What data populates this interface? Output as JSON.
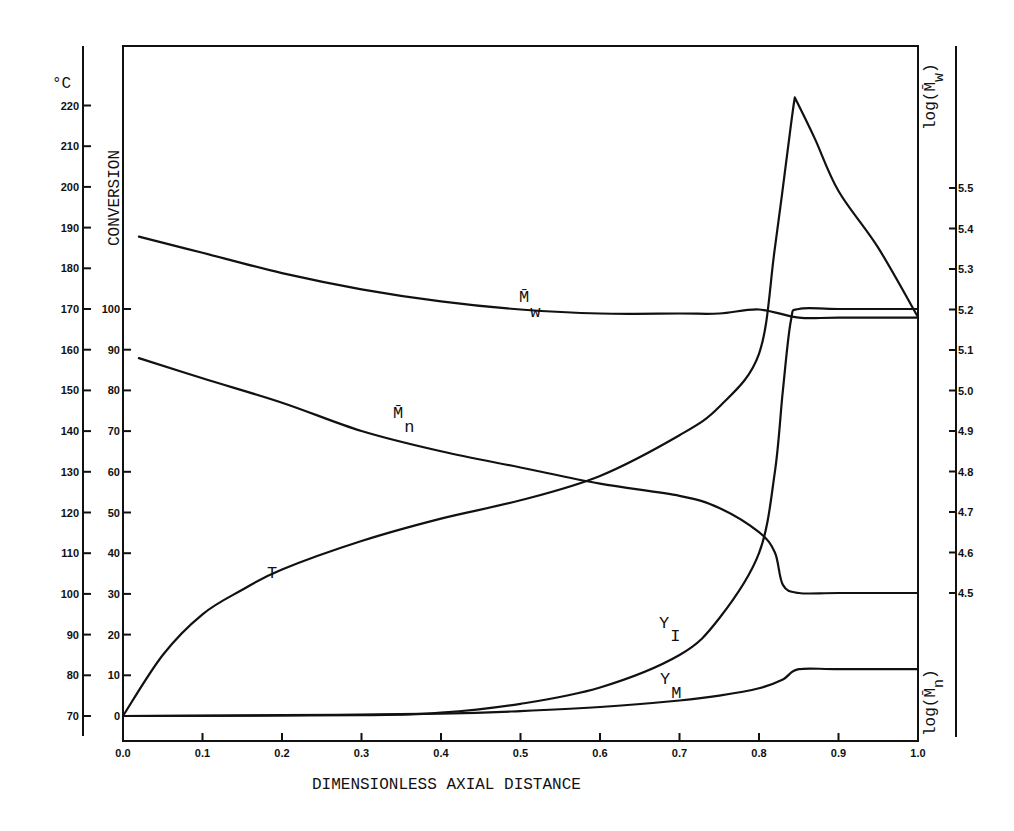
{
  "chart_data": {
    "type": "line",
    "title": "",
    "xlabel": "DIMENSIONLESS AXIAL DISTANCE",
    "xlim": [
      0.0,
      1.0
    ],
    "x_ticks": [
      "0.0",
      "0.1",
      "0.2",
      "0.3",
      "0.4",
      "0.5",
      "0.6",
      "0.7",
      "0.8",
      "0.9",
      "1.0"
    ],
    "axes": {
      "left_outer": {
        "label": "°C",
        "range": [
          70,
          220
        ],
        "ticks": [
          "220",
          "210",
          "200",
          "190",
          "180",
          "170",
          "160",
          "150",
          "140",
          "130",
          "120",
          "110",
          "100",
          "90",
          "80",
          "70"
        ]
      },
      "left_inner": {
        "label": "CONVERSION",
        "range": [
          0,
          100
        ],
        "ticks": [
          "100",
          "90",
          "80",
          "70",
          "60",
          "50",
          "40",
          "30",
          "20",
          "10",
          "0"
        ]
      },
      "right": {
        "label_top": "log(M̄w)",
        "label_bottom": "log(M̄n)",
        "range": [
          4.5,
          5.5
        ],
        "ticks": [
          "5.5",
          "5.4",
          "5.3",
          "5.2",
          "5.1",
          "5.0",
          "4.9",
          "4.8",
          "4.7",
          "4.6",
          "4.5"
        ]
      }
    },
    "grid": false,
    "legend": "inline labels",
    "series": [
      {
        "name": "T",
        "axis": "°C",
        "x": [
          0.0,
          0.05,
          0.1,
          0.15,
          0.2,
          0.3,
          0.4,
          0.5,
          0.6,
          0.7,
          0.75,
          0.8,
          0.82,
          0.84,
          0.845,
          0.87,
          0.9,
          0.95,
          1.0
        ],
        "y": [
          70,
          85,
          95,
          101,
          106,
          113,
          118.5,
          123,
          129,
          139,
          146,
          159,
          185,
          215,
          222,
          212,
          199,
          185,
          168
        ]
      },
      {
        "name": "Y_I",
        "axis": "CONVERSION",
        "x": [
          0.0,
          0.3,
          0.4,
          0.5,
          0.6,
          0.7,
          0.75,
          0.8,
          0.82,
          0.83,
          0.84,
          0.85,
          0.9,
          1.0
        ],
        "y": [
          0,
          0.2,
          0.8,
          3,
          7,
          15,
          24,
          40,
          60,
          80,
          97,
          100,
          100,
          100
        ]
      },
      {
        "name": "Y_M",
        "axis": "CONVERSION",
        "x": [
          0.0,
          0.2,
          0.4,
          0.5,
          0.6,
          0.7,
          0.75,
          0.8,
          0.83,
          0.85,
          0.9,
          1.0
        ],
        "y": [
          0,
          0.2,
          0.6,
          1.2,
          2.2,
          3.8,
          5,
          6.8,
          9,
          11.5,
          11.5,
          11.5
        ]
      },
      {
        "name": "M̄w",
        "axis": "log",
        "x": [
          0.02,
          0.1,
          0.2,
          0.3,
          0.4,
          0.5,
          0.6,
          0.7,
          0.75,
          0.8,
          0.85,
          0.9,
          1.0
        ],
        "y": [
          5.38,
          5.34,
          5.29,
          5.25,
          5.22,
          5.2,
          5.19,
          5.19,
          5.19,
          5.2,
          5.18,
          5.18,
          5.18
        ]
      },
      {
        "name": "M̄n",
        "axis": "log",
        "x": [
          0.02,
          0.1,
          0.2,
          0.3,
          0.4,
          0.5,
          0.6,
          0.7,
          0.75,
          0.8,
          0.82,
          0.83,
          0.85,
          0.9,
          1.0
        ],
        "y": [
          5.08,
          5.03,
          4.97,
          4.9,
          4.85,
          4.81,
          4.77,
          4.74,
          4.71,
          4.65,
          4.6,
          4.52,
          4.5,
          4.5,
          4.5
        ]
      }
    ],
    "annotations": [
      "T",
      "M̄w",
      "M̄n",
      "Y_I",
      "Y_M"
    ]
  },
  "labels": {
    "temp_unit": "°C",
    "conversion": "CONVERSION",
    "log_mw": "log(M̄",
    "log_mw_sub": "w",
    "log_mn": "log(M̄",
    "log_mn_sub": "n",
    "xlabel": "DIMENSIONLESS AXIAL DISTANCE",
    "curve_T": "T",
    "curve_Mw": "M̄",
    "curve_Mw_sub": "w",
    "curve_Mn": "M̄",
    "curve_Mn_sub": "n",
    "curve_YI": "Y",
    "curve_YI_sub": "I",
    "curve_YM": "Y",
    "curve_YM_sub": "M"
  }
}
